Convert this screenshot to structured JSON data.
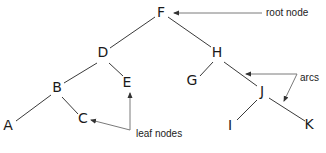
{
  "diagram": {
    "type": "tree",
    "colors": {
      "node_text": "#1a1a1a",
      "edge": "#3a3a3a",
      "pointer": "#7a7a7a",
      "background": "#ffffff"
    },
    "nodes": [
      {
        "id": "F",
        "label": "F",
        "x": 161,
        "y": 17
      },
      {
        "id": "D",
        "label": "D",
        "x": 103,
        "y": 57
      },
      {
        "id": "H",
        "label": "H",
        "x": 217,
        "y": 57
      },
      {
        "id": "B",
        "label": "B",
        "x": 57,
        "y": 92
      },
      {
        "id": "E",
        "label": "E",
        "x": 127,
        "y": 87
      },
      {
        "id": "G",
        "label": "G",
        "x": 192,
        "y": 85
      },
      {
        "id": "J",
        "label": "J",
        "x": 262,
        "y": 96
      },
      {
        "id": "A",
        "label": "A",
        "x": 8,
        "y": 130
      },
      {
        "id": "C",
        "label": "C",
        "x": 83,
        "y": 123
      },
      {
        "id": "I",
        "label": "I",
        "x": 230,
        "y": 130
      },
      {
        "id": "K",
        "label": "K",
        "x": 309,
        "y": 129
      }
    ],
    "edges": [
      {
        "from": "F",
        "to": "D",
        "x1": 155,
        "y1": 17,
        "x2": 110,
        "y2": 48
      },
      {
        "from": "F",
        "to": "H",
        "x1": 168,
        "y1": 17,
        "x2": 211,
        "y2": 47
      },
      {
        "from": "D",
        "to": "B",
        "x1": 97,
        "y1": 63,
        "x2": 64,
        "y2": 83
      },
      {
        "from": "D",
        "to": "E",
        "x1": 109,
        "y1": 63,
        "x2": 123,
        "y2": 76
      },
      {
        "from": "H",
        "to": "G",
        "x1": 213,
        "y1": 62,
        "x2": 200,
        "y2": 76
      },
      {
        "from": "H",
        "to": "J",
        "x1": 224,
        "y1": 62,
        "x2": 257,
        "y2": 86
      },
      {
        "from": "B",
        "to": "A",
        "x1": 51,
        "y1": 95,
        "x2": 16,
        "y2": 121
      },
      {
        "from": "B",
        "to": "C",
        "x1": 62,
        "y1": 97,
        "x2": 78,
        "y2": 114
      },
      {
        "from": "J",
        "to": "I",
        "x1": 257,
        "y1": 100,
        "x2": 237,
        "y2": 120
      },
      {
        "from": "J",
        "to": "K",
        "x1": 269,
        "y1": 98,
        "x2": 305,
        "y2": 121
      }
    ],
    "annotations": [
      {
        "label": "root node",
        "x": 266,
        "y": 16,
        "pointers": [
          {
            "x1": 262,
            "y1": 13,
            "x2": 174,
            "y2": 13
          }
        ]
      },
      {
        "label": "arcs",
        "x": 300,
        "y": 81,
        "pointers": [
          {
            "x1": 297,
            "y1": 74,
            "x2": 246,
            "y2": 74
          },
          {
            "x1": 297,
            "y1": 74,
            "x2": 284,
            "y2": 101
          }
        ]
      },
      {
        "label": "leaf nodes",
        "x": 136,
        "y": 137,
        "pointers": [
          {
            "x1": 130,
            "y1": 130,
            "x2": 130,
            "y2": 93
          },
          {
            "x1": 130,
            "y1": 130,
            "x2": 91,
            "y2": 120
          }
        ]
      }
    ]
  }
}
